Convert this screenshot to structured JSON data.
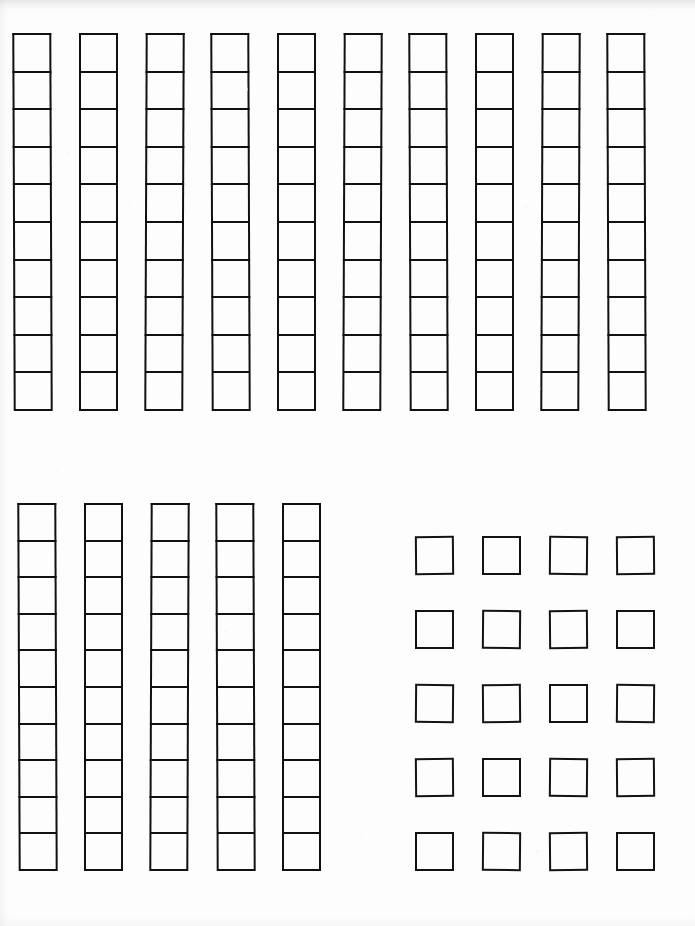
{
  "document": {
    "kind": "scanned-worksheet",
    "title": "Base-Ten Blocks",
    "media": "paper-scan",
    "background_color": "#fdfdfd",
    "ink_color": "#111111",
    "page_width": 695,
    "page_height": 926,
    "visible_text": "",
    "notes_label": "",
    "total_value_label": ""
  },
  "chart_data": {
    "type": "table",
    "xlabel": "",
    "ylabel": "",
    "grid": false,
    "legend": "none",
    "categories": [
      "Tens group A",
      "Tens group B",
      "Ones group"
    ],
    "values": [
      100,
      50,
      20
    ],
    "series": [
      {
        "name": "rods",
        "values": [
          10,
          5,
          0
        ]
      },
      {
        "name": "units per rod",
        "values": [
          10,
          10,
          1
        ]
      },
      {
        "name": "total units",
        "values": [
          100,
          50,
          20
        ]
      }
    ],
    "annotations": [
      "10 rods x 10 = 100",
      "5 rods x 10 = 50",
      "20 single units = 20",
      "grand total = 170"
    ]
  },
  "groups": [
    {
      "id": "tens-row-top",
      "name": "top-tens-row",
      "kind": "tens",
      "rod_count": 10,
      "cells_per_rod": 10,
      "value": 100,
      "left": 13,
      "top": 33,
      "rod_width": 39,
      "rod_height": 378,
      "rod_pitch": 66
    },
    {
      "id": "tens-row-bottom",
      "name": "bottom-tens-row",
      "kind": "tens",
      "rod_count": 5,
      "cells_per_rod": 10,
      "value": 50,
      "left": 18,
      "top": 503,
      "rod_width": 39,
      "rod_height": 368,
      "rod_pitch": 66
    },
    {
      "id": "ones-grid",
      "name": "ones-grid",
      "kind": "ones",
      "columns": 4,
      "rows": 5,
      "unit_count": 20,
      "value": 20,
      "left": 415,
      "top": 536,
      "unit_size": 39,
      "col_pitch": 67,
      "row_pitch": 74
    }
  ],
  "summary": {
    "tens_total": 15,
    "ones_total": 20,
    "grand_total": 170
  }
}
